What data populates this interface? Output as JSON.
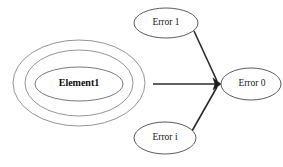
{
  "diagram": {
    "background_color": "#ffffff",
    "node_stroke_color": "#4a4a4a",
    "container_stroke_color": "#8a8a8a",
    "edge_color": "#2b2b2b",
    "container": {
      "label": "Element1",
      "ring_count": 3,
      "rings": [
        {
          "name": "outer-ring",
          "cx": 79,
          "cy": 83,
          "rx": 66,
          "ry": 43
        },
        {
          "name": "middle-ring",
          "cx": 79,
          "cy": 83,
          "rx": 54,
          "ry": 33
        },
        {
          "name": "inner-ring",
          "cx": 79,
          "cy": 84,
          "rx": 44,
          "ry": 17
        }
      ],
      "label_x": 79,
      "label_y": 84
    },
    "nodes": [
      {
        "id": "error-1",
        "label": "Error 1",
        "cx": 166,
        "cy": 23,
        "rx": 32,
        "ry": 15
      },
      {
        "id": "error-i",
        "label": "Error i",
        "cx": 165,
        "cy": 138,
        "rx": 31,
        "ry": 16
      },
      {
        "id": "error-0",
        "label": "Error 0",
        "cx": 251,
        "cy": 84,
        "rx": 30,
        "ry": 16
      }
    ],
    "edges": [
      {
        "id": "edge-element1-to-error0",
        "from": "element1-container",
        "to": "error-0",
        "x1": 153,
        "y1": 84,
        "x2": 218,
        "y2": 84,
        "arrow": true
      },
      {
        "id": "edge-error1-to-error0",
        "from": "error-1",
        "to": "error-0",
        "x1": 194,
        "y1": 31,
        "x2": 218,
        "y2": 83,
        "arrow": true
      },
      {
        "id": "edge-errori-to-error0",
        "from": "error-i",
        "to": "error-0",
        "x1": 192,
        "y1": 131,
        "x2": 218,
        "y2": 85,
        "arrow": true
      }
    ],
    "arrow_convergence_point": {
      "x": 219,
      "y": 84
    }
  }
}
